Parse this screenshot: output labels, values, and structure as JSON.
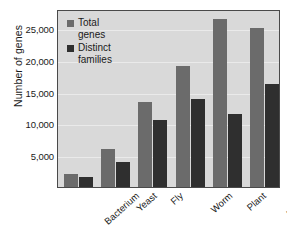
{
  "chart_data": {
    "type": "bar",
    "title": "",
    "xlabel": "",
    "ylabel": "Number of genes",
    "ylim": [
      0,
      28000
    ],
    "grid": true,
    "legend_position": "top-left",
    "categories": [
      "Bacterium",
      "Yeast",
      "Fly",
      "Worm",
      "Plant",
      "Human"
    ],
    "yticks": [
      5000,
      10000,
      15000,
      20000,
      25000
    ],
    "ytick_labels": [
      "5,000",
      "10,000",
      "15,000",
      "20,000",
      "25,000"
    ],
    "series": [
      {
        "name": "Total genes",
        "color": "#6b6b6b",
        "values": [
          2000,
          6000,
          13300,
          19000,
          26500,
          25000
        ]
      },
      {
        "name": "Distinct families",
        "color": "#2f2f2f",
        "values": [
          1500,
          4000,
          10600,
          13800,
          11500,
          16200
        ]
      }
    ]
  },
  "legend": {
    "items": [
      {
        "label": "Total\ngenes",
        "swatch": "total"
      },
      {
        "label": "Distinct\nfamilies",
        "swatch": "distinct"
      }
    ]
  },
  "colors": {
    "total_series": "#6b6b6b",
    "distinct_series": "#2f2f2f",
    "plot_background": "#d9d9d9",
    "gridline": "#eaeaea",
    "axis_border": "#4a4a4a",
    "page_background": "#ffffff"
  }
}
